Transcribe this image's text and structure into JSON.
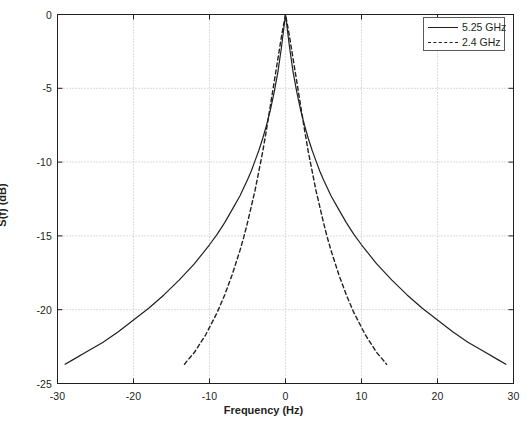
{
  "chart_data": {
    "type": "line",
    "title": "",
    "xlabel": "Frequency (Hz)",
    "ylabel": "S(f) (dB)",
    "xlim": [
      -30,
      30
    ],
    "ylim": [
      -25,
      0
    ],
    "xticks": [
      -30,
      -20,
      -10,
      0,
      10,
      20,
      30
    ],
    "xtick_labels": [
      "-30",
      "-20",
      "-10",
      "0",
      "10",
      "20",
      "30"
    ],
    "yticks": [
      0,
      -5,
      -10,
      -15,
      -20,
      -25
    ],
    "ytick_labels": [
      "0",
      "-5",
      "-10",
      "-15",
      "-20",
      "-25"
    ],
    "grid": true,
    "grid_style": "dotted",
    "grid_color": "#b3b3b3",
    "axis_color": "#231f20",
    "background": "#ffffff",
    "legend_position": "top-right",
    "series": [
      {
        "name": "5.25 GHz",
        "style": "solid",
        "color": "#231f20",
        "x": [
          -29,
          -28,
          -26,
          -24,
          -22,
          -20,
          -18,
          -16,
          -14,
          -12,
          -10,
          -9,
          -8,
          -7,
          -6,
          -5,
          -4.5,
          -4,
          -3.5,
          -3,
          -2.5,
          -2,
          -1.5,
          -1,
          -0.5,
          0,
          0.5,
          1,
          1.5,
          2,
          2.5,
          3,
          3.5,
          4,
          4.5,
          5,
          6,
          7,
          8,
          9,
          10,
          12,
          14,
          16,
          18,
          20,
          22,
          24,
          26,
          28,
          29
        ],
        "y": [
          -23.7,
          -23.4,
          -22.8,
          -22.2,
          -21.5,
          -20.7,
          -19.9,
          -19.0,
          -18.0,
          -16.9,
          -15.6,
          -14.9,
          -14.1,
          -13.2,
          -12.3,
          -11.2,
          -10.6,
          -9.9,
          -9.2,
          -8.4,
          -7.5,
          -6.5,
          -5.3,
          -3.9,
          -2.1,
          0.0,
          -2.1,
          -3.9,
          -5.3,
          -6.5,
          -7.5,
          -8.4,
          -9.2,
          -9.9,
          -10.6,
          -11.2,
          -12.3,
          -13.2,
          -14.1,
          -14.9,
          -15.6,
          -16.9,
          -18.0,
          -19.0,
          -19.9,
          -20.7,
          -21.5,
          -22.2,
          -22.8,
          -23.4,
          -23.7
        ]
      },
      {
        "name": "2.4 GHz",
        "style": "dashed",
        "color": "#231f20",
        "x": [
          -13.3,
          -13,
          -12.5,
          -12,
          -11.5,
          -11,
          -10.5,
          -10,
          -9.5,
          -9,
          -8.5,
          -8,
          -7.5,
          -7,
          -6.5,
          -6,
          -5.5,
          -5,
          -4.5,
          -4,
          -3.5,
          -3,
          -2.5,
          -2,
          -1.5,
          -1,
          -0.5,
          0,
          0.5,
          1,
          1.5,
          2,
          2.5,
          3,
          3.5,
          4,
          4.5,
          5,
          5.5,
          6,
          6.5,
          7,
          7.5,
          8,
          8.5,
          9,
          9.5,
          10,
          10.5,
          11,
          11.5,
          12,
          12.5,
          13,
          13.3
        ],
        "y": [
          -23.7,
          -23.5,
          -23.2,
          -22.9,
          -22.5,
          -22.1,
          -21.7,
          -21.2,
          -20.7,
          -20.2,
          -19.6,
          -19.0,
          -18.3,
          -17.6,
          -16.8,
          -16.0,
          -15.1,
          -14.1,
          -13.0,
          -11.9,
          -10.6,
          -9.3,
          -7.8,
          -6.2,
          -4.6,
          -3.0,
          -1.4,
          0.0,
          -1.4,
          -3.0,
          -4.6,
          -6.2,
          -7.8,
          -9.3,
          -10.6,
          -11.9,
          -13.0,
          -14.1,
          -15.1,
          -16.0,
          -16.8,
          -17.6,
          -18.3,
          -19.0,
          -19.6,
          -20.2,
          -20.7,
          -21.2,
          -21.7,
          -22.1,
          -22.5,
          -22.9,
          -23.2,
          -23.5,
          -23.7
        ]
      }
    ]
  }
}
